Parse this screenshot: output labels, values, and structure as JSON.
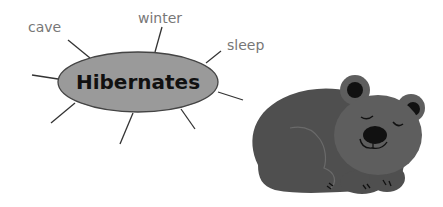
{
  "diagram": {
    "type": "word-web",
    "center": {
      "label": "Hibernates",
      "fill": "#9a9a9a",
      "stroke": "#444444"
    },
    "labels": [
      {
        "text": "cave"
      },
      {
        "text": "winter"
      },
      {
        "text": "sleep"
      }
    ],
    "empty_spokes": 5,
    "image": {
      "subject": "sleeping-bear",
      "body_color": "#505050",
      "face_color": "#5e5e5e",
      "feature_color": "#111111"
    }
  }
}
